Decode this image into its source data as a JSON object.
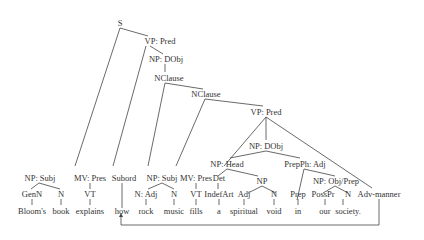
{
  "diagram": {
    "type": "syntax-tree",
    "nodes": {
      "S": "S",
      "vp_pred_1": "VP: Pred",
      "np_dobj_1": "NP: DObj",
      "nclause_1": "NClause",
      "nclause_2": "NClause",
      "vp_pred_2": "VP: Pred",
      "np_dobj_2": "NP: DObj",
      "np_head": "NP: Head",
      "prepph_adj": "PrepPh: Adj",
      "np": "NP",
      "np_objprep": "NP: Obj/Prep",
      "np_subj_1": "NP: Subj",
      "mv_pres_1": "MV: Pres",
      "subord": "Subord",
      "np_subj_2": "NP: Subj",
      "mv_pres_2": "MV: Pres",
      "det": "Det"
    },
    "pos": [
      "GenN",
      "N",
      "VT",
      "N: Adj",
      "N",
      "VT",
      "IndefArt",
      "Adj",
      "N",
      "Prep",
      "PossPr",
      "N",
      "Adv-manner"
    ],
    "words": [
      "Bloom's",
      "book",
      "explains",
      "how",
      "rock",
      "music",
      "fills",
      "a",
      "spiritual",
      "void",
      "in",
      "our",
      "society."
    ]
  }
}
